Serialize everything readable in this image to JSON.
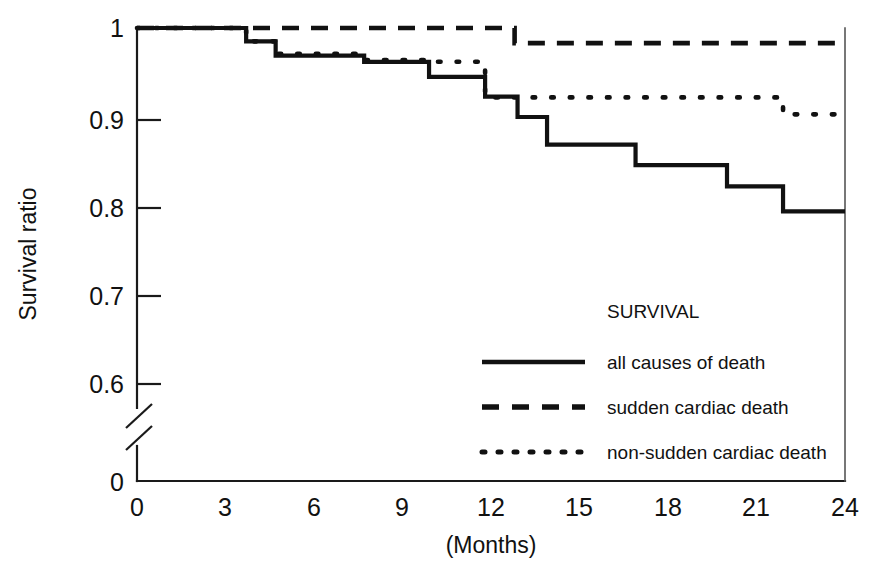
{
  "chart_data": {
    "type": "line",
    "title": "",
    "subtitle": "",
    "xlabel": "(Months)",
    "ylabel": "Survival ratio",
    "xlim": [
      0,
      24
    ],
    "ylim": [
      0.55,
      1.0
    ],
    "y_axis_break": true,
    "y_break_labels": [
      "0"
    ],
    "grid": false,
    "legend_position": "inside-lower-right",
    "legend_title": "SURVIVAL",
    "x_ticks": [
      0,
      3,
      6,
      9,
      12,
      15,
      18,
      21,
      24
    ],
    "x_tick_labels": [
      "0",
      "3",
      "6",
      "9",
      "12",
      "15",
      "18",
      "21",
      "24"
    ],
    "y_ticks": [
      0.6,
      0.7,
      0.8,
      0.9,
      1.0
    ],
    "y_tick_labels": [
      "0.6",
      "0.7",
      "0.8",
      "0.9",
      "1"
    ],
    "y_zero_label": "0",
    "series": [
      {
        "name": "all causes of death",
        "style": "solid",
        "color": "#111111",
        "steps": [
          {
            "x": 0.0,
            "y": 1.0
          },
          {
            "x": 3.7,
            "y": 1.0
          },
          {
            "x": 3.7,
            "y": 0.985
          },
          {
            "x": 4.7,
            "y": 0.985
          },
          {
            "x": 4.7,
            "y": 0.969
          },
          {
            "x": 7.7,
            "y": 0.969
          },
          {
            "x": 7.7,
            "y": 0.962
          },
          {
            "x": 9.9,
            "y": 0.962
          },
          {
            "x": 9.9,
            "y": 0.945
          },
          {
            "x": 11.8,
            "y": 0.945
          },
          {
            "x": 11.8,
            "y": 0.923
          },
          {
            "x": 12.9,
            "y": 0.923
          },
          {
            "x": 12.9,
            "y": 0.9
          },
          {
            "x": 13.9,
            "y": 0.9
          },
          {
            "x": 13.9,
            "y": 0.869
          },
          {
            "x": 16.9,
            "y": 0.869
          },
          {
            "x": 16.9,
            "y": 0.846
          },
          {
            "x": 20.0,
            "y": 0.846
          },
          {
            "x": 20.0,
            "y": 0.822
          },
          {
            "x": 21.9,
            "y": 0.822
          },
          {
            "x": 21.9,
            "y": 0.794
          },
          {
            "x": 24.0,
            "y": 0.794
          }
        ]
      },
      {
        "name": "sudden cardiac death",
        "style": "dashed",
        "color": "#111111",
        "steps": [
          {
            "x": 0.0,
            "y": 1.0
          },
          {
            "x": 12.8,
            "y": 1.0
          },
          {
            "x": 12.8,
            "y": 0.983
          },
          {
            "x": 24.0,
            "y": 0.983
          }
        ]
      },
      {
        "name": "non-sudden cardiac death",
        "style": "dotted",
        "color": "#111111",
        "steps": [
          {
            "x": 0.0,
            "y": 1.0
          },
          {
            "x": 3.7,
            "y": 1.0
          },
          {
            "x": 3.7,
            "y": 0.985
          },
          {
            "x": 4.7,
            "y": 0.985
          },
          {
            "x": 4.7,
            "y": 0.971
          },
          {
            "x": 7.7,
            "y": 0.971
          },
          {
            "x": 7.7,
            "y": 0.964
          },
          {
            "x": 9.9,
            "y": 0.964
          },
          {
            "x": 9.9,
            "y": 0.962
          },
          {
            "x": 11.8,
            "y": 0.962
          },
          {
            "x": 11.8,
            "y": 0.922
          },
          {
            "x": 21.9,
            "y": 0.922
          },
          {
            "x": 21.9,
            "y": 0.903
          },
          {
            "x": 24.0,
            "y": 0.903
          }
        ]
      }
    ]
  },
  "axes": {
    "y_label": "Survival ratio",
    "x_label": "(Months)",
    "y_tick_1": "1",
    "y_tick_09": "0.9",
    "y_tick_08": "0.8",
    "y_tick_07": "0.7",
    "y_tick_06": "0.6",
    "y_tick_0": "0",
    "x_tick_0": "0",
    "x_tick_3": "3",
    "x_tick_6": "6",
    "x_tick_9": "9",
    "x_tick_12": "12",
    "x_tick_15": "15",
    "x_tick_18": "18",
    "x_tick_21": "21",
    "x_tick_24": "24"
  },
  "legend": {
    "title": "SURVIVAL",
    "items": [
      {
        "label": "all causes of death",
        "style": "solid"
      },
      {
        "label": "sudden cardiac death",
        "style": "dashed"
      },
      {
        "label": "non-sudden cardiac death",
        "style": "dotted"
      }
    ]
  }
}
